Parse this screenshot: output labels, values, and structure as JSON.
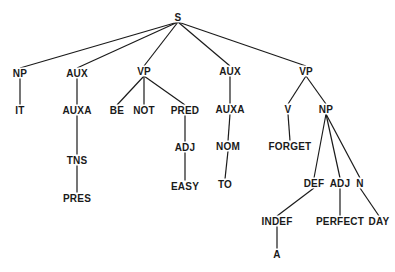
{
  "diagram": {
    "type": "syntax-tree",
    "colors": {
      "line": "#1a1a1a",
      "text": "#1a1a1a",
      "background": "#ffffff"
    },
    "nodes": [
      {
        "id": "s",
        "label": "S",
        "x": 178,
        "y": 17
      },
      {
        "id": "np1",
        "label": "NP",
        "x": 20,
        "y": 73
      },
      {
        "id": "it",
        "label": "IT",
        "x": 20,
        "y": 110
      },
      {
        "id": "aux1",
        "label": "AUX",
        "x": 77,
        "y": 73
      },
      {
        "id": "auxa1",
        "label": "AUXA",
        "x": 77,
        "y": 110
      },
      {
        "id": "tns",
        "label": "TNS",
        "x": 77,
        "y": 160
      },
      {
        "id": "pres",
        "label": "PRES",
        "x": 77,
        "y": 198
      },
      {
        "id": "vp1",
        "label": "VP",
        "x": 144,
        "y": 71
      },
      {
        "id": "be",
        "label": "BE",
        "x": 117,
        "y": 110
      },
      {
        "id": "not",
        "label": "NOT",
        "x": 144,
        "y": 110
      },
      {
        "id": "pred",
        "label": "PRED",
        "x": 185,
        "y": 110
      },
      {
        "id": "adj1",
        "label": "ADJ",
        "x": 185,
        "y": 147
      },
      {
        "id": "easy",
        "label": "EASY",
        "x": 185,
        "y": 186
      },
      {
        "id": "aux2",
        "label": "AUX",
        "x": 230,
        "y": 71
      },
      {
        "id": "auxa2",
        "label": "AUXA",
        "x": 230,
        "y": 109
      },
      {
        "id": "nom",
        "label": "NOM",
        "x": 228,
        "y": 146
      },
      {
        "id": "to",
        "label": "TO",
        "x": 225,
        "y": 184
      },
      {
        "id": "vp2",
        "label": "VP",
        "x": 306,
        "y": 71
      },
      {
        "id": "v",
        "label": "V",
        "x": 288,
        "y": 109
      },
      {
        "id": "forget",
        "label": "FORGET",
        "x": 290,
        "y": 146
      },
      {
        "id": "np2",
        "label": "NP",
        "x": 326,
        "y": 109
      },
      {
        "id": "def",
        "label": "DEF",
        "x": 314,
        "y": 183
      },
      {
        "id": "adj2",
        "label": "ADJ",
        "x": 340,
        "y": 183
      },
      {
        "id": "n",
        "label": "N",
        "x": 360,
        "y": 183
      },
      {
        "id": "indef",
        "label": "INDEF",
        "x": 277,
        "y": 221
      },
      {
        "id": "a",
        "label": "A",
        "x": 277,
        "y": 254
      },
      {
        "id": "perfect",
        "label": "PERFECT",
        "x": 340,
        "y": 221
      },
      {
        "id": "day",
        "label": "DAY",
        "x": 379,
        "y": 221
      }
    ],
    "edges": [
      [
        "s",
        "np1"
      ],
      [
        "s",
        "aux1"
      ],
      [
        "s",
        "vp1"
      ],
      [
        "s",
        "aux2"
      ],
      [
        "s",
        "vp2"
      ],
      [
        "np1",
        "it"
      ],
      [
        "aux1",
        "auxa1"
      ],
      [
        "auxa1",
        "tns"
      ],
      [
        "tns",
        "pres"
      ],
      [
        "vp1",
        "be"
      ],
      [
        "vp1",
        "not"
      ],
      [
        "vp1",
        "pred"
      ],
      [
        "pred",
        "adj1"
      ],
      [
        "adj1",
        "easy"
      ],
      [
        "aux2",
        "auxa2"
      ],
      [
        "auxa2",
        "nom"
      ],
      [
        "nom",
        "to"
      ],
      [
        "vp2",
        "v"
      ],
      [
        "vp2",
        "np2"
      ],
      [
        "v",
        "forget"
      ],
      [
        "np2",
        "def"
      ],
      [
        "np2",
        "adj2"
      ],
      [
        "np2",
        "n"
      ],
      [
        "def",
        "indef"
      ],
      [
        "indef",
        "a"
      ],
      [
        "adj2",
        "perfect"
      ],
      [
        "n",
        "day"
      ]
    ]
  }
}
